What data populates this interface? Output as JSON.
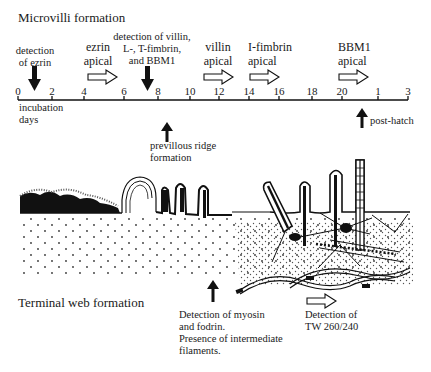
{
  "titles": {
    "microvilli": "Microvilli formation",
    "terminal_web": "Terminal web formation"
  },
  "timeline": {
    "ticks": [
      {
        "label": "0",
        "x": 18
      },
      {
        "label": "2",
        "x": 52
      },
      {
        "label": "4",
        "x": 84
      },
      {
        "label": "6",
        "x": 124
      },
      {
        "label": "8",
        "x": 158
      },
      {
        "label": "10",
        "x": 190
      },
      {
        "label": "12",
        "x": 219
      },
      {
        "label": "14",
        "x": 249
      },
      {
        "label": "16",
        "x": 279
      },
      {
        "label": "18",
        "x": 312
      },
      {
        "label": "20",
        "x": 342
      },
      {
        "label": "1",
        "x": 378
      },
      {
        "label": "3",
        "x": 408
      }
    ],
    "axis_label_line1": "incubation",
    "axis_label_line2": "days",
    "post_hatch": "post-hatch"
  },
  "microvilli_events": [
    {
      "id": "ezrin-detection",
      "line1": "detection",
      "line2": "of ezrin",
      "marker": "solid-down-arrow"
    },
    {
      "id": "ezrin-apical",
      "line1": "ezrin",
      "line2": "apical",
      "marker": "open-right-arrow"
    },
    {
      "id": "villin-detection",
      "line1": "detection of villin,",
      "line2": "L-, T-fimbrin,",
      "line3": "and BBM1",
      "marker": "solid-down-arrow"
    },
    {
      "id": "villin-apical",
      "line1": "villin",
      "line2": "apical",
      "marker": "open-right-arrow"
    },
    {
      "id": "ifimbrin-apical",
      "line1": "I-fimbrin",
      "line2": "apical",
      "marker": "open-right-arrow"
    },
    {
      "id": "bbm1-apical",
      "line1": "BBM1",
      "line2": "apical",
      "marker": "open-right-arrow"
    }
  ],
  "ridge_event": {
    "line1": "previllous ridge",
    "line2": "formation",
    "marker": "solid-up-arrow"
  },
  "terminal_web_events": [
    {
      "id": "myosin",
      "line1": "Detection of myosin",
      "line2": "and fodrin.",
      "line3": "Presence of intermediate",
      "line4": "filaments.",
      "marker": "solid-up-arrow"
    },
    {
      "id": "tw260",
      "line1": "Detection of",
      "line2": "TW 260/240",
      "marker": "open-right-arrow"
    }
  ]
}
